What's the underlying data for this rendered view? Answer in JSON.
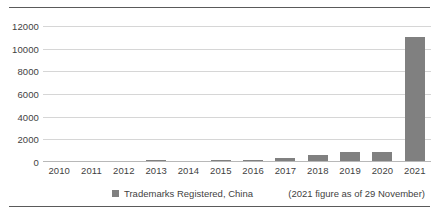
{
  "chart_data": {
    "type": "bar",
    "title": "",
    "xlabel": "",
    "ylabel": "",
    "ylim": [
      0,
      12000
    ],
    "yticks": [
      0,
      2000,
      4000,
      6000,
      8000,
      10000,
      12000
    ],
    "ytick_labels": [
      "0",
      "2000",
      "4000",
      "6000",
      "8000",
      "10000",
      "12000"
    ],
    "grid": true,
    "legend_position": "bottom",
    "categories": [
      "2010",
      "2011",
      "2012",
      "2013",
      "2014",
      "2015",
      "2016",
      "2017",
      "2018",
      "2019",
      "2020",
      "2021"
    ],
    "series": [
      {
        "name": "Trademarks Registered, China",
        "color": "#808080",
        "values": [
          60,
          70,
          110,
          150,
          110,
          160,
          200,
          330,
          640,
          900,
          880,
          11000
        ]
      }
    ],
    "annotations": [
      "(2021 figure as of 29 November)"
    ]
  },
  "legend": {
    "entries": [
      {
        "label": "Trademarks Registered, China",
        "color": "#808080"
      }
    ]
  },
  "note": "(2021 figure as of 29 November)",
  "colors": {
    "bar": "#808080",
    "grid": "#d6d6d6",
    "rule": "#5a5a5a",
    "text": "#3f3f3f"
  }
}
